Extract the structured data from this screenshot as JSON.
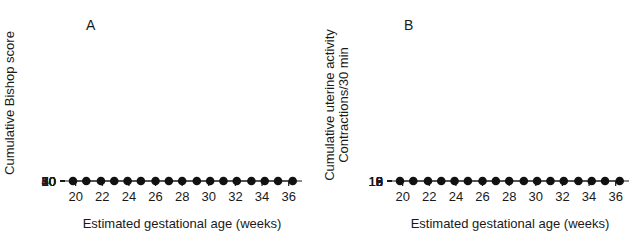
{
  "figure": {
    "panels": [
      {
        "letter": "A",
        "name": "panel-a",
        "ylabel": "Cumulative Bishop score",
        "xlabel": "Estimated gestational age (weeks)"
      },
      {
        "letter": "B",
        "name": "panel-b",
        "ylabel_line1": "Cumulative uterine activity",
        "ylabel_line2": "Contractions/30 min",
        "xlabel": "Estimated gestational age (weeks)"
      }
    ]
  },
  "chart_data": [
    {
      "type": "line",
      "panel": "A",
      "title": "",
      "xlabel": "Estimated gestational age (weeks)",
      "ylabel": "Cumulative Bishop score",
      "xlim": [
        19.2,
        37.0
      ],
      "ylim": [
        0,
        70
      ],
      "xticks": [
        20,
        22,
        24,
        26,
        28,
        30,
        32,
        34,
        36
      ],
      "yticks": [
        10,
        20,
        30,
        40,
        50,
        60,
        70
      ],
      "grid": false,
      "legend": "none",
      "error_direction": "down",
      "x": [
        19.8,
        20.8,
        21.9,
        22.9,
        23.9,
        24.9,
        26.0,
        27.0,
        28.0,
        29.1,
        30.1,
        31.1,
        32.1,
        33.2,
        34.2,
        35.2,
        36.3
      ],
      "values": [
        2.0,
        2.7,
        3.9,
        5.3,
        7.8,
        10.3,
        13.6,
        17.5,
        21.2,
        25.3,
        29.7,
        34.2,
        39.5,
        45.5,
        51.3,
        58.2,
        65.7
      ],
      "errors": [
        0.0,
        0.0,
        0.0,
        0.0,
        0.0,
        2.6,
        2.6,
        3.1,
        3.5,
        3.3,
        3.4,
        3.6,
        3.8,
        4.2,
        4.3,
        4.6,
        4.3
      ]
    },
    {
      "type": "line",
      "panel": "B",
      "title": "",
      "xlabel": "Estimated gestational age (weeks)",
      "ylabel": "Cumulative uterine activity Contractions/30 min",
      "xlim": [
        19.2,
        37.0
      ],
      "ylim": [
        0,
        18
      ],
      "xticks": [
        20,
        22,
        24,
        26,
        28,
        30,
        32,
        34,
        36
      ],
      "yticks": [
        0,
        3,
        6,
        9,
        12,
        15,
        18
      ],
      "grid": false,
      "legend": "none",
      "error_direction": "up",
      "x": [
        19.8,
        20.8,
        21.9,
        22.9,
        23.9,
        24.9,
        26.0,
        27.0,
        28.0,
        29.1,
        30.1,
        31.1,
        32.1,
        33.2,
        34.2,
        35.2,
        36.3
      ],
      "values": [
        0.1,
        0.4,
        0.6,
        1.0,
        1.4,
        1.7,
        2.1,
        2.25,
        2.7,
        3.35,
        4.2,
        5.4,
        6.5,
        8.1,
        9.6,
        11.5,
        14.0
      ],
      "errors": [
        0.0,
        0.0,
        0.0,
        0.0,
        0.75,
        0.75,
        0.8,
        0.85,
        1.1,
        1.5,
        1.5,
        1.7,
        1.6,
        1.8,
        1.9,
        1.9,
        2.7
      ]
    }
  ]
}
